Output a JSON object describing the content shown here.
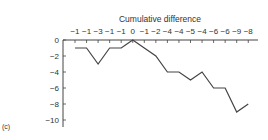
{
  "panel_label": "(c)",
  "chart_data": {
    "type": "line",
    "title": "Cumulative difference",
    "xlabel": "",
    "ylabel": "",
    "top_labels": [
      "−1",
      "−1",
      "−3",
      "−1",
      "−1",
      "0",
      "−1",
      "−2",
      "−4",
      "−4",
      "−5",
      "−4",
      "−6",
      "−6",
      "−9",
      "−8"
    ],
    "series": [
      {
        "name": "Cumulative difference",
        "values": [
          -1,
          -1,
          -3,
          -1,
          -1,
          0,
          -1,
          -2,
          -4,
          -4,
          -5,
          -4,
          -6,
          -6,
          -9,
          -8
        ]
      }
    ],
    "ylim": [
      -10,
      0
    ],
    "yticks": [
      0,
      -2,
      -4,
      -6,
      -8,
      -10
    ],
    "ytick_labels": [
      "0",
      "−2",
      "−4",
      "−6",
      "−8",
      "−10"
    ],
    "grid": false,
    "line_color": "#444444"
  }
}
